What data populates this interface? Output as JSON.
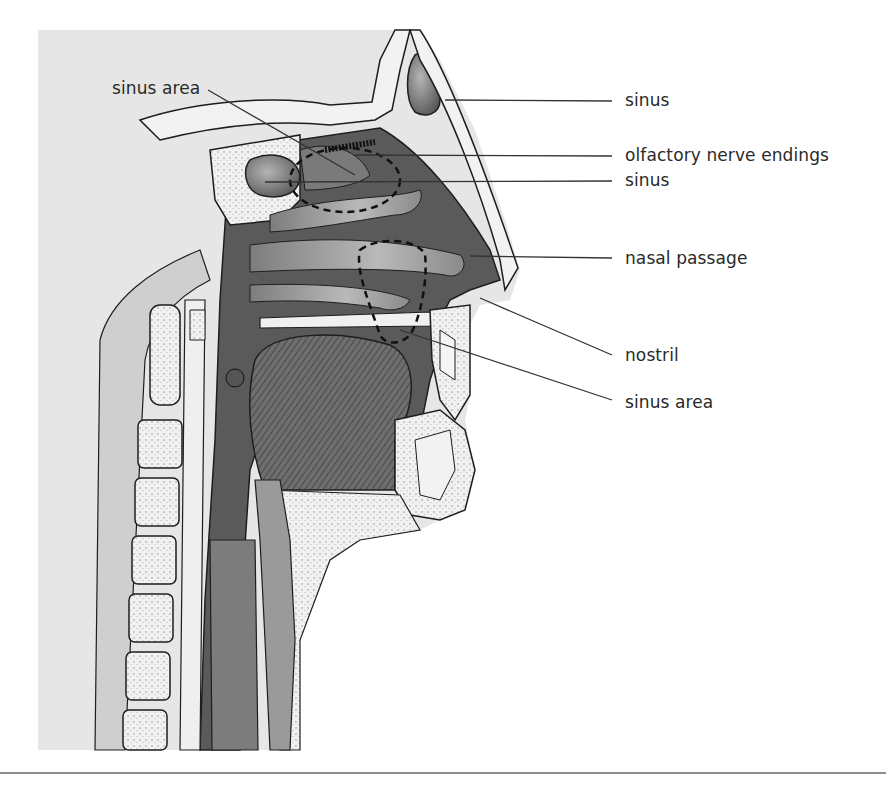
{
  "figure": {
    "labels": [
      {
        "id": "sinus-area-top",
        "text": "sinus area",
        "x": 112,
        "y": 87
      },
      {
        "id": "sinus-frontal",
        "text": "sinus",
        "x": 625,
        "y": 93
      },
      {
        "id": "olfactory",
        "text": "olfactory nerve endings",
        "x": 625,
        "y": 148
      },
      {
        "id": "sinus-sphenoid",
        "text": "sinus",
        "x": 625,
        "y": 173
      },
      {
        "id": "nasal-passage",
        "text": "nasal passage",
        "x": 625,
        "y": 251
      },
      {
        "id": "nostril",
        "text": "nostril",
        "x": 625,
        "y": 348
      },
      {
        "id": "sinus-area-bottom",
        "text": "sinus area",
        "x": 625,
        "y": 395
      }
    ]
  },
  "colors": {
    "background_panel": "#e6e6e6",
    "cavity_dark": "#5a5a5a",
    "bone_light": "#efefef",
    "tissue_mid": "#9a9a9a",
    "outline": "#1e1e1e",
    "leader_line": "#333333",
    "rule": "#8c8c8c"
  }
}
